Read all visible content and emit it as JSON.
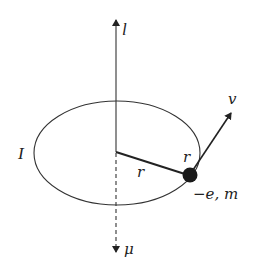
{
  "figure": {
    "colors": {
      "stroke": "#333333",
      "electron": "#1a1a1a",
      "background": "#ffffff"
    },
    "labels": {
      "angular_momentum": "l",
      "magnetic_moment": "μ",
      "current": "I",
      "radius_inner": "r",
      "radius_outer": "r",
      "velocity": "v",
      "charge_mass": "−e, m"
    },
    "elements": {
      "axis_up_arrow": "angular momentum vector l (solid, pointing up)",
      "axis_down_arrow": "magnetic moment vector μ (dashed, pointing down)",
      "orbit": "elliptical orbit (circle in perspective)",
      "radius_line": "radius r from center to electron",
      "electron": "charge −e, mass m",
      "velocity_arrow": "velocity v tangent to orbit"
    }
  }
}
